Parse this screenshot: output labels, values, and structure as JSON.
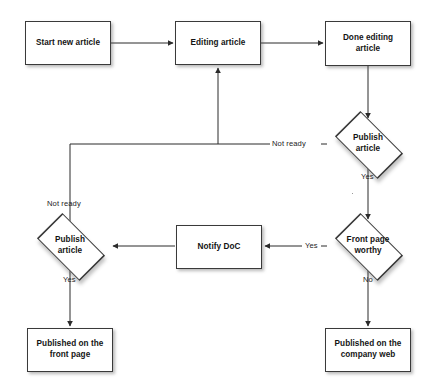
{
  "diagram": {
    "type": "flowchart",
    "background": "#ffffff",
    "line_color": "#2b2b2b",
    "node_fill": "#ffffff",
    "node_stroke": "#3a3a3a",
    "text_color": "#141414"
  },
  "nodes": [
    {
      "id": "start-new-article",
      "shape": "process",
      "label": "Start new article"
    },
    {
      "id": "editing-article",
      "shape": "process",
      "label": "Editing article"
    },
    {
      "id": "done-editing-article",
      "shape": "process",
      "label": "Done editing article"
    },
    {
      "id": "publish-article-top",
      "shape": "decision",
      "label": "Publish article"
    },
    {
      "id": "front-page-worthy",
      "shape": "decision",
      "label": "Front page worthy"
    },
    {
      "id": "notify-doc",
      "shape": "process",
      "label": "Notify DoC"
    },
    {
      "id": "publish-article-bottom",
      "shape": "decision",
      "label": "Publish article"
    },
    {
      "id": "published-front-page",
      "shape": "process",
      "label": "Published on the front page"
    },
    {
      "id": "published-company-web",
      "shape": "process",
      "label": "Published on the company web"
    }
  ],
  "node_text": {
    "start_new_article": "Start new article",
    "editing_article": "Editing article",
    "done_editing_line1": "Done editing",
    "done_editing_line2": "article",
    "publish_top_line1": "Publish",
    "publish_top_line2": "article",
    "front_page_line1": "Front page",
    "front_page_line2": "worthy",
    "notify_doc": "Notify DoC",
    "publish_bottom_line1": "Publish",
    "publish_bottom_line2": "article",
    "published_front_line1": "Published on the",
    "published_front_line2": "front page",
    "published_web_line1": "Published on the",
    "published_web_line2": "company web"
  },
  "edge_labels": {
    "not_ready_top": "Not ready",
    "yes_publish_top": "Yes",
    "yes_front_page": "Yes",
    "not_ready_bottom": "Not ready",
    "yes_publish_bottom": "Yes",
    "no_front_page": "No"
  },
  "edges": [
    {
      "from": "start-new-article",
      "to": "editing-article",
      "label": ""
    },
    {
      "from": "editing-article",
      "to": "done-editing-article",
      "label": ""
    },
    {
      "from": "done-editing-article",
      "to": "publish-article-top",
      "label": ""
    },
    {
      "from": "publish-article-top",
      "to": "editing-article",
      "label": "Not ready"
    },
    {
      "from": "publish-article-top",
      "to": "front-page-worthy",
      "label": "Yes"
    },
    {
      "from": "front-page-worthy",
      "to": "notify-doc",
      "label": "Yes"
    },
    {
      "from": "front-page-worthy",
      "to": "published-company-web",
      "label": "No"
    },
    {
      "from": "notify-doc",
      "to": "publish-article-bottom",
      "label": ""
    },
    {
      "from": "publish-article-bottom",
      "to": "published-front-page",
      "label": "Yes"
    },
    {
      "from": "publish-article-bottom",
      "to": "editing-article",
      "label": "Not ready"
    }
  ]
}
